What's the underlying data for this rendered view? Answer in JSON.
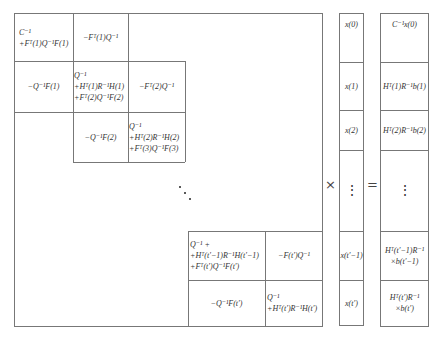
{
  "matrix": {
    "blocks": [
      {
        "id": "b11",
        "lines": [
          "C⁻¹",
          "+Fᵀ(1)Q⁻¹F(1)"
        ]
      },
      {
        "id": "b12",
        "lines": [
          "−Fᵀ(1)Q⁻¹"
        ]
      },
      {
        "id": "b21",
        "lines": [
          "−Q⁻¹F(1)"
        ]
      },
      {
        "id": "b22",
        "lines": [
          "Q⁻¹",
          "+Hᵀ(1)R⁻¹H(1)",
          "+Fᵀ(2)Q⁻¹F(2)"
        ]
      },
      {
        "id": "b23",
        "lines": [
          "−Fᵀ(2)Q⁻¹"
        ]
      },
      {
        "id": "b32",
        "lines": [
          "−Q⁻¹F(2)"
        ]
      },
      {
        "id": "b33",
        "lines": [
          "Q⁻¹",
          "+Hᵀ(2)R⁻¹H(2)",
          "+Fᵀ(3)Q⁻¹F(3)"
        ]
      },
      {
        "id": "bnn_1",
        "lines": [
          "Q⁻¹ +",
          "+Hᵀ(t′−1)R⁻¹H(t′−1)",
          "+Fᵀ(t′)Q⁻¹F(t′)"
        ]
      },
      {
        "id": "bn_1n",
        "lines": [
          "−F(t′)Q⁻¹"
        ]
      },
      {
        "id": "bnn_1b",
        "lines": [
          "−Q⁻¹F(t′)"
        ]
      },
      {
        "id": "bnn",
        "lines": [
          "Q⁻¹",
          "+Hᵀ(t′)R⁻¹H(t′)"
        ]
      }
    ],
    "ellipsis": "diagonal-dots"
  },
  "operators": {
    "times": "×",
    "equals": "="
  },
  "x_vector": [
    "x(0)",
    "x(1)",
    "x(2)",
    "⋮",
    "x(t′−1)",
    "x(t′)"
  ],
  "rhs_vector": [
    [
      "C⁻¹x(0)"
    ],
    [
      "Hᵀ(1)R⁻¹b(1)"
    ],
    [
      "Hᵀ(2)R⁻¹b(2)"
    ],
    [
      "⋮"
    ],
    [
      "Hᵀ(t′−1)R⁻¹",
      "×b(t′−1)"
    ],
    [
      "Hᵀ(t′)R⁻¹",
      "×b(t′)"
    ]
  ]
}
